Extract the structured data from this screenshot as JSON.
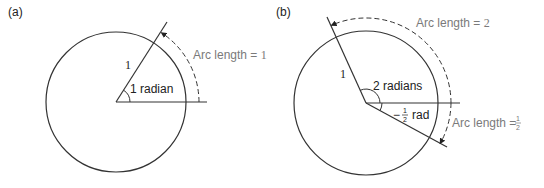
{
  "panels": [
    {
      "id": "a",
      "label": "(a)",
      "radius_label": "1",
      "angle_label": "1 radian",
      "arc_label_prefix": "Arc length = ",
      "arc_label_value": "1",
      "angle_rad": 1.0
    },
    {
      "id": "b",
      "label": "(b)",
      "radius_label": "1",
      "angle_label": "2 radians",
      "neg_angle_prefix": "−",
      "neg_angle_num": "1",
      "neg_angle_den": "2",
      "neg_angle_suffix": "rad",
      "arc_label_prefix": "Arc length = ",
      "arc_label_value": "2",
      "arc2_label_prefix": "Arc length = ",
      "arc2_label_num": "1",
      "arc2_label_den": "2",
      "angle_rad": 2.0,
      "neg_angle_rad": -0.5
    }
  ],
  "colors": {
    "line": "#333333",
    "annotation": "#7a7a7a"
  }
}
